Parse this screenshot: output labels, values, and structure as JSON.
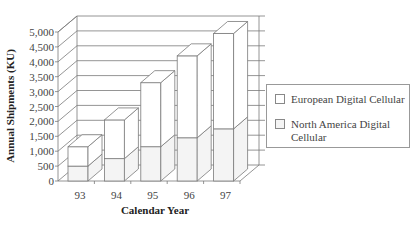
{
  "chart_data": {
    "type": "bar",
    "subtype": "3d-stacked",
    "title": "",
    "xlabel": "Calendar Year",
    "ylabel": "Annual Shipments (KU)",
    "categories": [
      "93",
      "94",
      "95",
      "96",
      "97"
    ],
    "series": [
      {
        "name": "North America Digital Cellular",
        "values": [
          500,
          750,
          1150,
          1450,
          1750
        ],
        "color": "#f4f4f4"
      },
      {
        "name": "European Digital Cellular",
        "values": [
          650,
          1300,
          2150,
          2750,
          3200
        ],
        "color": "#ffffff"
      }
    ],
    "totals": [
      1150,
      2050,
      3300,
      4200,
      4950
    ],
    "yticks": [
      "0",
      "500",
      "1,000",
      "1,500",
      "2,000",
      "2,500",
      "3,000",
      "3,500",
      "4,000",
      "4,500",
      "5,000"
    ],
    "ylim": [
      0,
      5000
    ],
    "grid": true,
    "legend_position": "right"
  },
  "legend": {
    "items": [
      {
        "label": "European Digital Cellular"
      },
      {
        "label": "North America Digital",
        "label2": "Cellular"
      }
    ]
  },
  "colors": {
    "line": "#7a7a7a",
    "text": "#444444"
  }
}
